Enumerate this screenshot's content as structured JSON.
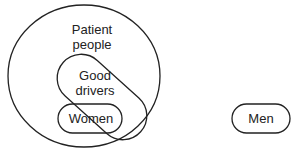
{
  "diagram": {
    "type": "venn",
    "sets": [
      {
        "id": "patient",
        "label_line1": "Patient",
        "label_line2": "people"
      },
      {
        "id": "good_drivers",
        "label_line1": "Good",
        "label_line2": "drivers"
      },
      {
        "id": "women",
        "label": "Women"
      },
      {
        "id": "men",
        "label": "Men"
      }
    ]
  }
}
